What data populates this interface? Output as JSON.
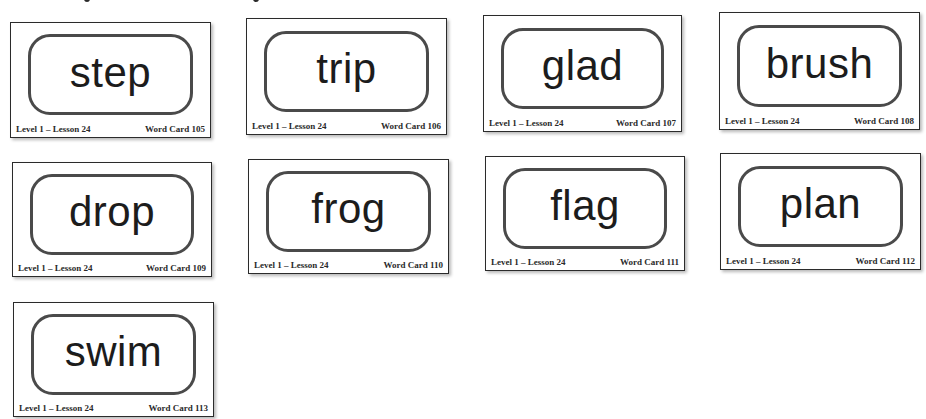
{
  "document": {
    "type": "word-card-sheet",
    "colors": {
      "card_border": "#2b2b2b",
      "frame_border": "#4a4a4a",
      "word_text": "#1c1c1c",
      "background": "#ffffff"
    }
  },
  "cards": [
    {
      "word": "step",
      "level_lesson": "Level 1 – Lesson 24",
      "card_label": "Word Card 105"
    },
    {
      "word": "trip",
      "level_lesson": "Level 1 – Lesson 24",
      "card_label": "Word Card 106"
    },
    {
      "word": "glad",
      "level_lesson": "Level 1 – Lesson 24",
      "card_label": "Word Card 107"
    },
    {
      "word": "brush",
      "level_lesson": "Level 1 – Lesson 24",
      "card_label": "Word Card 108"
    },
    {
      "word": "drop",
      "level_lesson": "Level 1 – Lesson 24",
      "card_label": "Word Card 109"
    },
    {
      "word": "frog",
      "level_lesson": "Level 1 – Lesson 24",
      "card_label": "Word Card 110"
    },
    {
      "word": "flag",
      "level_lesson": "Level 1 – Lesson 24",
      "card_label": "Word Card 111"
    },
    {
      "word": "plan",
      "level_lesson": "Level 1 – Lesson 24",
      "card_label": "Word Card 112"
    },
    {
      "word": "swim",
      "level_lesson": "Level 1 – Lesson 24",
      "card_label": "Word Card 113"
    }
  ]
}
